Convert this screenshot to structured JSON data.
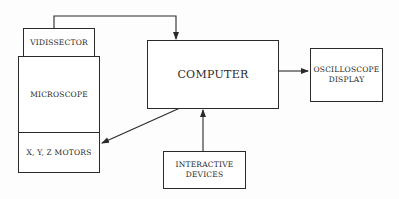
{
  "diagram": {
    "nodes": {
      "vidissector": {
        "label": "VIDISSECTOR"
      },
      "microscope": {
        "label": "MICROSCOPE"
      },
      "motors": {
        "label": "X, Y, Z MOTORS"
      },
      "computer": {
        "label": "COMPUTER"
      },
      "oscilloscope": {
        "label_line1": "OSCILLOSCOPE",
        "label_line2": "DISPLAY"
      },
      "interactive": {
        "label_line1": "INTERACTIVE",
        "label_line2": "DEVICES"
      }
    },
    "edges": [
      {
        "from": "vidissector",
        "to": "computer"
      },
      {
        "from": "computer",
        "to": "motors"
      },
      {
        "from": "computer",
        "to": "oscilloscope"
      },
      {
        "from": "interactive",
        "to": "computer"
      }
    ],
    "colors": {
      "line": "#2a2a2a",
      "background": "#ffffff"
    }
  }
}
